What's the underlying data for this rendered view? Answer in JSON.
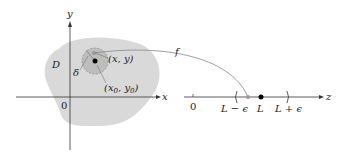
{
  "diagram": {
    "domain_label": "D",
    "axes": {
      "x_label": "x",
      "y_label": "y",
      "origin_label": "0"
    },
    "points": {
      "moving": "(x, y)",
      "center": "(x0, y0)"
    },
    "center_x_sub": "x",
    "center_x_sub_index": "0",
    "center_y_sub": "y",
    "center_y_sub_index": "0",
    "radius_label": "δ",
    "mapping_label": "f",
    "number_line": {
      "axis_label": "z",
      "origin_label": "0",
      "left_label": "L − ϵ",
      "center_label": "L",
      "right_label": "L + ϵ"
    },
    "colors": {
      "region_fill": "#d9d9d9",
      "disk_fill": "#bdbdbd",
      "axis": "#333333",
      "curve": "#888888"
    }
  }
}
